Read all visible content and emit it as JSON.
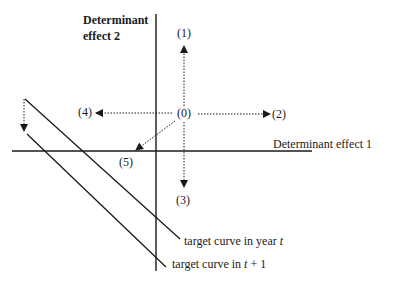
{
  "diagram": {
    "axis_y_label_line1": "Determinant",
    "axis_y_label_line2": "effect 2",
    "axis_x_label": "Determinant effect 1",
    "origin_label": "(0)",
    "arrows": [
      {
        "id": "1",
        "label": "(1)",
        "direction": "up"
      },
      {
        "id": "2",
        "label": "(2)",
        "direction": "right"
      },
      {
        "id": "3",
        "label": "(3)",
        "direction": "down"
      },
      {
        "id": "4",
        "label": "(4)",
        "direction": "left"
      },
      {
        "id": "5",
        "label": "(5)",
        "direction": "down-left"
      }
    ],
    "curves": [
      {
        "label_prefix": "target curve in year ",
        "label_var": "t",
        "label_suffix": ""
      },
      {
        "label_prefix": "target curve in ",
        "label_var": "t",
        "label_suffix": " + 1"
      }
    ],
    "colors": {
      "ink": "#1a1a1a",
      "background": "#ffffff"
    }
  }
}
